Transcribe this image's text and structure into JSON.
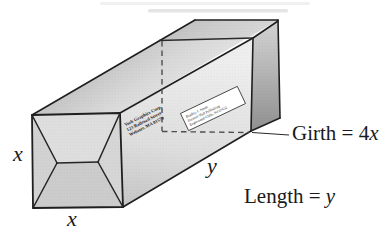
{
  "figure": {
    "dimension_labels": {
      "height_var": "x",
      "width_var": "x",
      "length_var": "y"
    },
    "annotations": {
      "girth_prefix": "Girth = 4",
      "girth_var": "x",
      "length_prefix": "Length = ",
      "length_var": "y"
    },
    "return_address_smallprint": {
      "line1": "York Graphics Corp.",
      "line2": "123 Railroad Street",
      "line3": "Webster, MA 01570"
    },
    "shipping_label_smallprint": {
      "line1": "Bradley J. Smith",
      "line2": "Prentice Hall Publishing",
      "line3": "Englewood Cliffs, NJ 07632"
    },
    "colors": {
      "outline": "#1f1f1f",
      "dashed_line": "#4d4d4d",
      "label_bg": "#ffffff",
      "text": "#1a1a1a"
    }
  }
}
